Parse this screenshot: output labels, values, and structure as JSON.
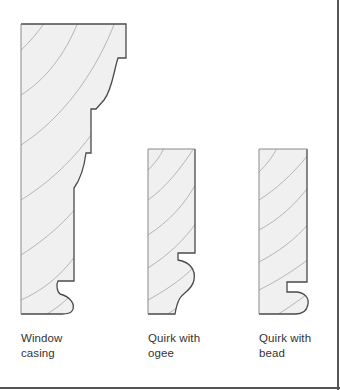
{
  "diagram": {
    "colors": {
      "fill": "#f0f0f0",
      "outline": "#4a4a4a",
      "grain": "#b5b5b5",
      "caption": "#333333",
      "frame": "#555555"
    },
    "profiles": [
      {
        "id": "window-casing",
        "caption_line1": "Window",
        "caption_line2": "casing"
      },
      {
        "id": "quirk-ogee",
        "caption_line1": "Quirk with",
        "caption_line2": "ogee"
      },
      {
        "id": "quirk-bead",
        "caption_line1": "Quirk with",
        "caption_line2": "bead"
      }
    ]
  }
}
